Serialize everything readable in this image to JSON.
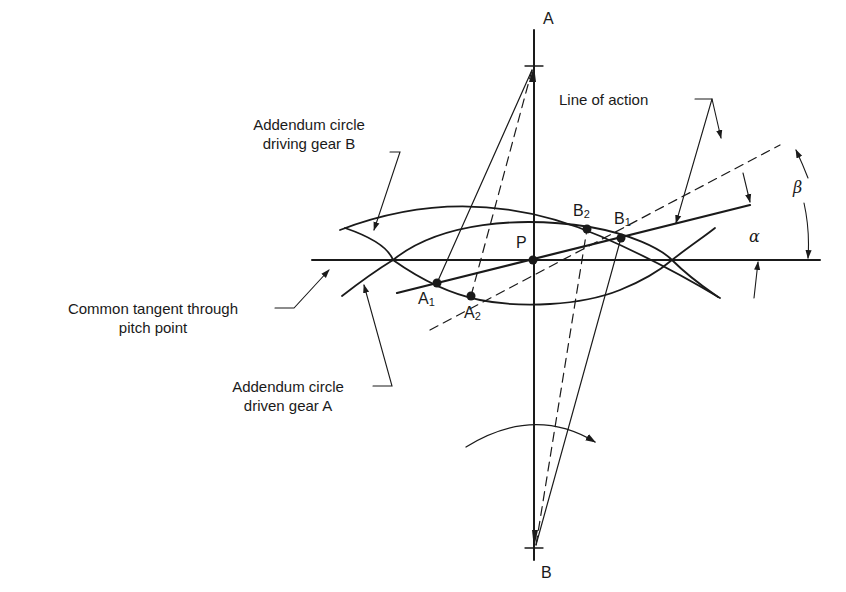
{
  "diagram": {
    "labels": {
      "addendum_driving": [
        "Addendum circle",
        "driving gear B"
      ],
      "addendum_driven": [
        "Addendum circle",
        "driven gear A"
      ],
      "common_tangent": [
        "Common tangent through",
        "pitch point"
      ],
      "line_of_action": "Line of action",
      "center_a": "A",
      "center_b": "B",
      "pitch_point": "P",
      "a1": {
        "base": "A",
        "sub": "1"
      },
      "a2": {
        "base": "A",
        "sub": "2"
      },
      "b1": {
        "base": "B",
        "sub": "1"
      },
      "b2": {
        "base": "B",
        "sub": "2"
      },
      "angle_alpha": "α",
      "angle_beta": "β"
    },
    "colors": {
      "ink": "#1a1a1a",
      "background": "#ffffff"
    }
  }
}
